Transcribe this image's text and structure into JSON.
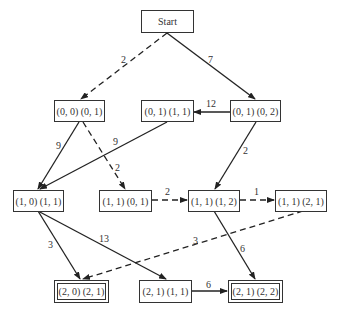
{
  "nodes": {
    "start": {
      "label": "Start"
    },
    "n00_01": {
      "label": "(0, 0) (0, 1)"
    },
    "n01_11": {
      "label": "(0, 1) (1, 1)"
    },
    "n01_02": {
      "label": "(0, 1) (0, 2)"
    },
    "n10_11": {
      "label": "(1, 0) (1, 1)"
    },
    "n11_01": {
      "label": "(1, 1) (0, 1)"
    },
    "n11_12": {
      "label": "(1, 1) (1, 2)"
    },
    "n11_21": {
      "label": "(1, 1) (2, 1)"
    },
    "n20_21": {
      "label": "(2, 0) (2, 1)",
      "goal": true
    },
    "n21_11": {
      "label": "(2, 1) (1, 1)"
    },
    "n21_22": {
      "label": "(2, 1) (2, 2)",
      "goal": true
    }
  },
  "edges": [
    {
      "from": "start",
      "to": "n00_01",
      "weight": "2",
      "style": "dashed"
    },
    {
      "from": "start",
      "to": "n01_02",
      "weight": "7",
      "style": "solid"
    },
    {
      "from": "n01_02",
      "to": "n01_11",
      "weight": "12",
      "style": "solid"
    },
    {
      "from": "n00_01",
      "to": "n10_11",
      "weight": "9",
      "style": "solid"
    },
    {
      "from": "n01_11",
      "to": "n10_11",
      "weight": "9",
      "style": "solid"
    },
    {
      "from": "n00_01",
      "to": "n11_01",
      "weight": "2",
      "style": "dashed"
    },
    {
      "from": "n01_02",
      "to": "n11_12",
      "weight": "2",
      "style": "solid"
    },
    {
      "from": "n11_01",
      "to": "n11_12",
      "weight": "2",
      "style": "dashed"
    },
    {
      "from": "n11_12",
      "to": "n11_21",
      "weight": "1",
      "style": "dashed"
    },
    {
      "from": "n10_11",
      "to": "n20_21",
      "weight": "3",
      "style": "solid"
    },
    {
      "from": "n10_11",
      "to": "n21_11",
      "weight": "13",
      "style": "solid"
    },
    {
      "from": "n11_21",
      "to": "n20_21",
      "weight": "3",
      "style": "dashed"
    },
    {
      "from": "n11_12",
      "to": "n21_22",
      "weight": "6",
      "style": "solid"
    },
    {
      "from": "n21_11",
      "to": "n21_22",
      "weight": "6",
      "style": "solid"
    }
  ]
}
